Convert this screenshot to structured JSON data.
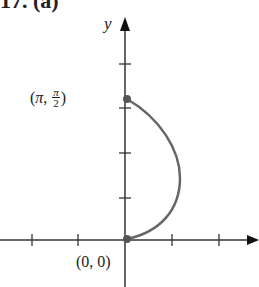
{
  "figure": {
    "title": "17. (a)",
    "y_axis_label": "y",
    "point_top": {
      "prefix": "(",
      "x": "π",
      "sep": ", ",
      "num": "π",
      "den": "2",
      "suffix": ")"
    },
    "point_origin": "(0, 0)",
    "colors": {
      "axis": "#333333",
      "curve": "#666666",
      "point": "#555555"
    }
  }
}
